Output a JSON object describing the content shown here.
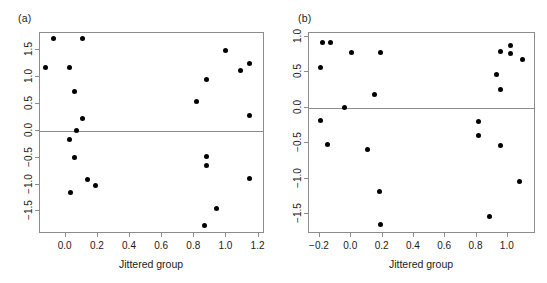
{
  "figure": {
    "width": 547,
    "height": 283,
    "background": "#ffffff",
    "point_color": "#000000",
    "axis_color": "#8c8c8c"
  },
  "chart_data": [
    {
      "type": "scatter",
      "panel_label": "(a)",
      "title": "",
      "xlabel": "Jittered group",
      "ylabel": "",
      "xlim": [
        -0.16,
        1.24
      ],
      "ylim": [
        -1.92,
        1.82
      ],
      "grid": false,
      "legend": "none",
      "reference_line_y": 0.0,
      "xticks": [
        0.0,
        0.2,
        0.4,
        0.6,
        0.8,
        1.0,
        1.2
      ],
      "xticklabels": [
        "0.0",
        "0.2",
        "0.4",
        "0.6",
        "0.8",
        "1.0",
        "1.2"
      ],
      "yticks": [
        1.5,
        1.0,
        0.5,
        0.0,
        -0.5,
        -1.0,
        -1.5
      ],
      "yticklabels": [
        "1.5",
        "1.0",
        "0.5",
        "0.0",
        "-0.5",
        "-1.0",
        "-1.5"
      ],
      "points": [
        {
          "x": -0.075,
          "y": 1.72
        },
        {
          "x": 0.105,
          "y": 1.72
        },
        {
          "x": -0.125,
          "y": 1.17
        },
        {
          "x": 0.025,
          "y": 1.17
        },
        {
          "x": 0.055,
          "y": 0.73
        },
        {
          "x": 0.105,
          "y": 0.22
        },
        {
          "x": 0.065,
          "y": 0.0
        },
        {
          "x": 0.025,
          "y": -0.16
        },
        {
          "x": 0.055,
          "y": -0.5
        },
        {
          "x": 0.135,
          "y": -0.9
        },
        {
          "x": 0.185,
          "y": -1.02
        },
        {
          "x": 0.03,
          "y": -1.15
        },
        {
          "x": 0.815,
          "y": 0.55
        },
        {
          "x": 0.875,
          "y": 0.96
        },
        {
          "x": 0.995,
          "y": 1.5
        },
        {
          "x": 1.085,
          "y": 1.13
        },
        {
          "x": 1.145,
          "y": 1.25
        },
        {
          "x": 1.145,
          "y": 0.29
        },
        {
          "x": 0.875,
          "y": -0.47
        },
        {
          "x": 0.875,
          "y": -0.64
        },
        {
          "x": 1.145,
          "y": -0.89
        },
        {
          "x": 0.94,
          "y": -1.45
        },
        {
          "x": 0.865,
          "y": -1.76
        }
      ]
    },
    {
      "type": "scatter",
      "panel_label": "(b)",
      "title": "",
      "xlabel": "Jittered group",
      "ylabel": "",
      "xlim": [
        -0.27,
        1.18
      ],
      "ylim": [
        -1.78,
        1.05
      ],
      "grid": false,
      "legend": "none",
      "reference_line_y": 0.0,
      "xticks": [
        -0.2,
        0.0,
        0.2,
        0.4,
        0.6,
        0.8,
        1.0
      ],
      "xticklabels": [
        "-0.2",
        "0.0",
        "0.2",
        "0.4",
        "0.6",
        "0.8",
        "1.0"
      ],
      "yticks": [
        1.0,
        0.5,
        0.0,
        -0.5,
        -1.0,
        -1.5
      ],
      "yticklabels": [
        "1.0",
        "0.5",
        "0.0",
        "-0.5",
        "-1.0",
        "-1.5"
      ],
      "points": [
        {
          "x": -0.185,
          "y": 0.91
        },
        {
          "x": -0.13,
          "y": 0.91
        },
        {
          "x": 0.0,
          "y": 0.77
        },
        {
          "x": 0.185,
          "y": 0.77
        },
        {
          "x": -0.195,
          "y": 0.56
        },
        {
          "x": 0.15,
          "y": 0.19
        },
        {
          "x": -0.045,
          "y": 0.0
        },
        {
          "x": -0.195,
          "y": -0.18
        },
        {
          "x": -0.15,
          "y": -0.52
        },
        {
          "x": 0.105,
          "y": -0.59
        },
        {
          "x": 0.18,
          "y": -1.18
        },
        {
          "x": 0.185,
          "y": -1.64
        },
        {
          "x": 0.955,
          "y": 0.79
        },
        {
          "x": 1.015,
          "y": 0.87
        },
        {
          "x": 1.015,
          "y": 0.76
        },
        {
          "x": 1.095,
          "y": 0.68
        },
        {
          "x": 0.925,
          "y": 0.46
        },
        {
          "x": 0.955,
          "y": 0.26
        },
        {
          "x": 0.815,
          "y": -0.19
        },
        {
          "x": 0.815,
          "y": -0.4
        },
        {
          "x": 0.955,
          "y": -0.54
        },
        {
          "x": 1.075,
          "y": -1.04
        },
        {
          "x": 0.885,
          "y": -1.54
        }
      ]
    }
  ]
}
